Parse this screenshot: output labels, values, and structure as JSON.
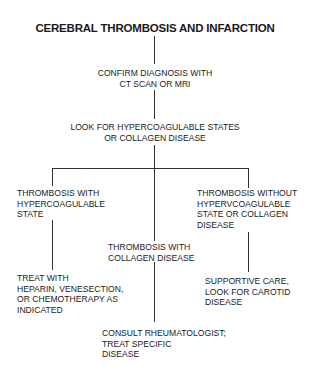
{
  "title": "CEREBRAL THROMBOSIS AND INFARCTION",
  "nodes": {
    "confirm": "CONFIRM DIAGNOSIS WITH\nCT SCAN OR MRI",
    "look_for": "LOOK FOR HYPERCOAGULABLE STATES\nOR COLLAGEN DISEASE",
    "thrombosis_hypercoag": "THROMBOSIS WITH\nHYPERCOAGULABLE\nSTATE",
    "thrombosis_collagen": "THROMBOSIS WITH\nCOLLAGEN DISEASE",
    "thrombosis_without": "THROMBOSIS WITHOUT\nHYPERVCOAGULABLE\nSTATE OR COLLAGEN\nDISEASE",
    "treat_heparin": "TREAT WITH\nHEPARIN, VENESECTION,\nOR CHEMOTHERAPY AS\nINDICATED",
    "supportive_care": "SUPPORTIVE CARE,\nLOOK FOR CAROTID\nDISEASE",
    "consult_rheum": "CONSULT RHEUMATOLOGIST;\nTREAT SPECIFIC\nDISEASE"
  },
  "edges": [
    {
      "from": "title",
      "to": "confirm"
    },
    {
      "from": "confirm",
      "to": "look_for"
    },
    {
      "from": "look_for",
      "to": "thrombosis_hypercoag"
    },
    {
      "from": "look_for",
      "to": "thrombosis_collagen"
    },
    {
      "from": "look_for",
      "to": "thrombosis_without"
    },
    {
      "from": "thrombosis_hypercoag",
      "to": "treat_heparin"
    },
    {
      "from": "thrombosis_collagen",
      "to": "consult_rheum"
    },
    {
      "from": "thrombosis_without",
      "to": "supportive_care"
    }
  ]
}
